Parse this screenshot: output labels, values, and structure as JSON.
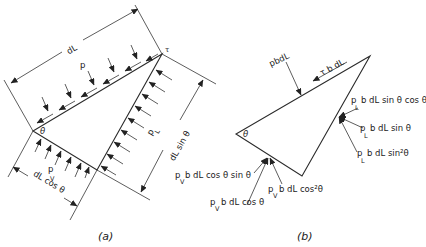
{
  "figure_a": {
    "caption": "(a)",
    "labels": {
      "dL": "dL",
      "p": "p",
      "tau": "τ",
      "theta": "θ",
      "pL_p": "p",
      "pL_sub": "L",
      "pV_p": "p",
      "pV_sub": "V",
      "dL_sin": "dL  sin θ",
      "dL_cos": "dL  cos θ"
    }
  },
  "figure_b": {
    "caption": "(b)",
    "labels": {
      "pbdL": "pbdL",
      "tau_bdL": "τ b dL",
      "theta": "θ",
      "pL_sin_cos": "b dL sin θ cos θ",
      "pL_sin": "b dL  sin θ",
      "pL_sin2": "b dL  sin²θ",
      "pV_cos_sin": "b dL  cos θ  sin θ",
      "pV_cos2": "b  dL  cos²θ",
      "pV_cos": "b  dL  cos θ",
      "p": "p",
      "sub_L": "L",
      "sub_V": "V"
    }
  }
}
